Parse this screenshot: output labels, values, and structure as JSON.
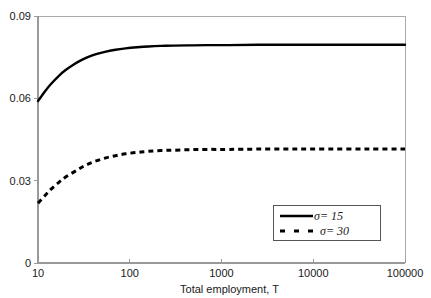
{
  "chart_data": {
    "type": "line",
    "title": "",
    "xlabel": "Total employment, T",
    "ylabel": "",
    "xscale": "log",
    "xlim": [
      10,
      100000
    ],
    "ylim": [
      0,
      0.09
    ],
    "grid": false,
    "legend_position": "bottom-right",
    "xticks": [
      {
        "value": 10,
        "label": "10"
      },
      {
        "value": 100,
        "label": "100"
      },
      {
        "value": 1000,
        "label": "1000"
      },
      {
        "value": 10000,
        "label": "10000"
      },
      {
        "value": 100000,
        "label": "100000"
      }
    ],
    "yticks": [
      {
        "value": 0,
        "label": "0"
      },
      {
        "value": 0.03,
        "label": "0.03"
      },
      {
        "value": 0.06,
        "label": "0.06"
      },
      {
        "value": 0.09,
        "label": "0.09"
      }
    ],
    "series": [
      {
        "name": "sigma-15",
        "legend_label": "σ= 15",
        "style": "solid",
        "color": "#000000",
        "width": 2.4,
        "x": [
          10,
          12,
          14,
          17,
          20,
          25,
          30,
          36,
          44,
          55,
          70,
          90,
          120,
          160,
          220,
          300,
          450,
          700,
          1200,
          2500,
          6000,
          15000,
          40000,
          100000
        ],
        "y": [
          0.059,
          0.0627,
          0.0654,
          0.0683,
          0.0703,
          0.0725,
          0.074,
          0.0752,
          0.0762,
          0.077,
          0.0777,
          0.0782,
          0.0786,
          0.0789,
          0.0791,
          0.0792,
          0.0793,
          0.0794,
          0.0794,
          0.0795,
          0.0795,
          0.0795,
          0.0795,
          0.0795
        ]
      },
      {
        "name": "sigma-30",
        "legend_label": "σ= 30",
        "style": "dashed",
        "color": "#000000",
        "width": 3.0,
        "dash": "5,4",
        "x": [
          10,
          12,
          14,
          17,
          20,
          25,
          30,
          36,
          44,
          55,
          70,
          90,
          120,
          160,
          220,
          300,
          450,
          700,
          1200,
          2500,
          6000,
          15000,
          40000,
          100000
        ],
        "y": [
          0.0218,
          0.0247,
          0.027,
          0.0295,
          0.0313,
          0.0333,
          0.0349,
          0.0362,
          0.0373,
          0.0383,
          0.0391,
          0.0398,
          0.0403,
          0.0407,
          0.041,
          0.0411,
          0.0413,
          0.0414,
          0.0414,
          0.0415,
          0.0415,
          0.0415,
          0.0415,
          0.0415
        ]
      }
    ]
  },
  "axes": {
    "line_color": "#999999",
    "frame_color": "#aaaaaa",
    "plot_left": 38,
    "plot_right": 405,
    "plot_top": 16,
    "plot_bottom": 263
  },
  "legend": {
    "box": {
      "x": 273,
      "y": 205,
      "width": 107,
      "height": 35
    },
    "border_color": "#555555",
    "entries": [
      {
        "label": "σ= 15",
        "style": "solid"
      },
      {
        "label": "σ= 30",
        "style": "dashed"
      }
    ]
  }
}
